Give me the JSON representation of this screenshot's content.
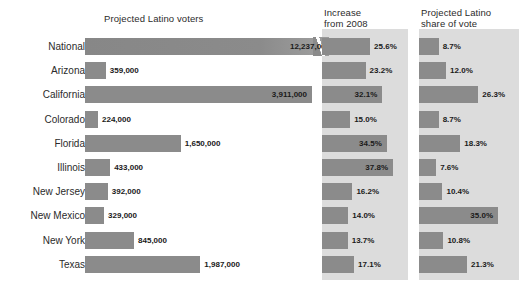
{
  "chart_data": {
    "type": "bar",
    "title": "",
    "layout": "three-panel horizontal bar chart",
    "categories": [
      "National",
      "Arizona",
      "California",
      "Colorado",
      "Florida",
      "Illinois",
      "New Jersey",
      "New Mexico",
      "New York",
      "Texas"
    ],
    "panels": [
      {
        "title": "Projected Latino voters",
        "unit": "voters",
        "values": [
          12237000,
          359000,
          3911000,
          224000,
          1650000,
          433000,
          392000,
          329000,
          845000,
          1987000
        ],
        "labels": [
          "12,237,000",
          "359,000",
          "3,911,000",
          "224,000",
          "1,650,000",
          "433,000",
          "392,000",
          "329,000",
          "845,000",
          "1,987,000"
        ],
        "note": "National bar drawn with a diagonal break mark indicating a truncated scale"
      },
      {
        "title": "Increase\nfrom 2008",
        "unit": "percent",
        "values": [
          25.6,
          23.2,
          32.1,
          15.0,
          34.5,
          37.8,
          16.2,
          14.0,
          13.7,
          17.1
        ],
        "labels": [
          "25.6%",
          "23.2%",
          "32.1%",
          "15.0%",
          "34.5%",
          "37.8%",
          "16.2%",
          "14.0%",
          "13.7%",
          "17.1%"
        ]
      },
      {
        "title": "Projected Latino\nshare of vote",
        "unit": "percent",
        "values": [
          8.7,
          12.0,
          26.3,
          8.7,
          18.3,
          7.6,
          10.4,
          35.0,
          10.8,
          21.3
        ],
        "labels": [
          "8.7%",
          "12.0%",
          "26.3%",
          "8.7%",
          "18.3%",
          "7.6%",
          "10.4%",
          "35.0%",
          "10.8%",
          "21.3%"
        ]
      }
    ],
    "colors": {
      "bar": "#8b8b8b",
      "panel_background": "#dcdcdc",
      "page_background": "#ffffff",
      "text": "#2b2b2b"
    }
  }
}
